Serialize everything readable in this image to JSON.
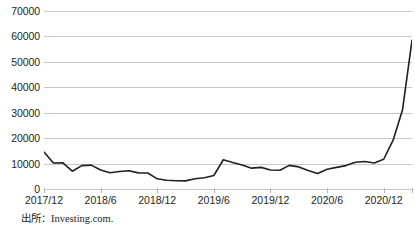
{
  "chart_data": {
    "type": "line",
    "title": "",
    "subtitle": "",
    "xlabel": "",
    "ylabel": "",
    "grid": true,
    "legend": false,
    "ylim": [
      0,
      70000
    ],
    "ytick_values": [
      70000,
      60000,
      50000,
      40000,
      30000,
      20000,
      10000,
      0
    ],
    "ytick_labels": [
      "70000",
      "60000",
      "50000",
      "40000",
      "30000",
      "20000",
      "10000",
      "0"
    ],
    "xtick_labels": [
      "2017/12",
      "2018/6",
      "2018/12",
      "2019/6",
      "2019/12",
      "2020/6",
      "2020/12"
    ],
    "xtick_index": [
      0,
      6,
      12,
      18,
      24,
      30,
      36
    ],
    "x": [
      "2017/12",
      "2018/1",
      "2018/2",
      "2018/3",
      "2018/4",
      "2018/5",
      "2018/6",
      "2018/7",
      "2018/8",
      "2018/9",
      "2018/10",
      "2018/11",
      "2018/12",
      "2019/1",
      "2019/2",
      "2019/3",
      "2019/4",
      "2019/5",
      "2019/6",
      "2019/7",
      "2019/8",
      "2019/9",
      "2019/10",
      "2019/11",
      "2019/12",
      "2020/1",
      "2020/2",
      "2020/3",
      "2020/4",
      "2020/5",
      "2020/6",
      "2020/7",
      "2020/8",
      "2020/9",
      "2020/10",
      "2020/11",
      "2020/12",
      "2021/1",
      "2021/2",
      "2021/3"
    ],
    "series": [
      {
        "name": "Bitcoin",
        "color": "#231f20",
        "values": [
          14500,
          10200,
          10300,
          7000,
          9200,
          9400,
          7500,
          6400,
          6900,
          7200,
          6350,
          6300,
          4000,
          3450,
          3250,
          3200,
          4000,
          4450,
          5300,
          11500,
          10400,
          9400,
          8200,
          8500,
          7500,
          7350,
          9300,
          8700,
          7300,
          6100,
          7800,
          8500,
          9200,
          10500,
          10800,
          10200,
          11700,
          19200,
          31200,
          58500
        ]
      }
    ],
    "annotations": {
      "last_point_value": 55500,
      "peak_value": 58500,
      "min_value": 3200
    }
  },
  "footer": {
    "source_label": "出所：Investing.com."
  }
}
